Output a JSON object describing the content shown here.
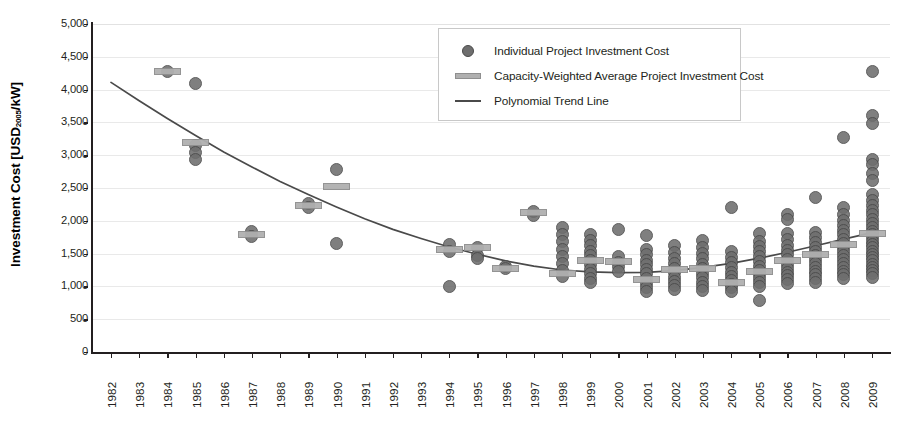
{
  "chart_data": {
    "type": "scatter",
    "title": "",
    "xlabel": "",
    "ylabel": "Investment Cost [USD2005/kW]",
    "ylabel_prefix": "Investment Cost [USD",
    "ylabel_sub": "2005",
    "ylabel_suffix": "/kW]",
    "xlim": [
      1982,
      2009
    ],
    "ylim": [
      0,
      5000
    ],
    "ytick_step": 500,
    "grid": true,
    "legend_position": "top-center",
    "colors": {
      "point_fill": "#6e6e6e",
      "point_stroke": "#4a4a4a",
      "avg_bar_fill": "#b0b0b0",
      "avg_bar_stroke": "#8f8f8f",
      "trend_line": "#4a4a4a",
      "axis": "#231f20",
      "gridline": "#e9e9e9",
      "background": "#ffffff"
    },
    "categories": [
      "1982",
      "1983",
      "1984",
      "1985",
      "1986",
      "1987",
      "1988",
      "1989",
      "1990",
      "1991",
      "1992",
      "1993",
      "1994",
      "1995",
      "1996",
      "1997",
      "1998",
      "1999",
      "2000",
      "2001",
      "2002",
      "2003",
      "2004",
      "2005",
      "2006",
      "2007",
      "2008",
      "2009"
    ],
    "yticks": [
      "0",
      "500",
      "1,000",
      "1,500",
      "2,000",
      "2,500",
      "3,000",
      "3,500",
      "4,000",
      "4,500",
      "5,000"
    ],
    "legend": [
      {
        "id": "individual",
        "marker": "circle",
        "label": "Individual Project Investment Cost"
      },
      {
        "id": "capacity-weighted-average",
        "marker": "bar",
        "label": "Capacity-Weighted Average Project Investment Cost"
      },
      {
        "id": "trend",
        "marker": "line",
        "label": "Polynomial Trend Line"
      }
    ],
    "series": [
      {
        "name": "Individual Project Investment Cost",
        "type": "scatter",
        "points": [
          {
            "x": 1984,
            "values": [
              4270
            ]
          },
          {
            "x": 1985,
            "values": [
              4100,
              3150,
              3040,
              2930
            ]
          },
          {
            "x": 1987,
            "values": [
              1840,
              1760
            ]
          },
          {
            "x": 1989,
            "values": [
              2260,
              2210
            ]
          },
          {
            "x": 1990,
            "values": [
              2780,
              1660
            ]
          },
          {
            "x": 1994,
            "values": [
              1640,
              1540,
              1000
            ]
          },
          {
            "x": 1995,
            "values": [
              1600,
              1470,
              1420
            ]
          },
          {
            "x": 1996,
            "values": [
              1310,
              1270
            ]
          },
          {
            "x": 1997,
            "values": [
              2140,
              2080
            ]
          },
          {
            "x": 1998,
            "values": [
              1900,
              1790,
              1680,
              1570,
              1460,
              1350,
              1240,
              1150
            ]
          },
          {
            "x": 1999,
            "values": [
              1790,
              1700,
              1620,
              1540,
              1470,
              1400,
              1330,
              1260,
              1190,
              1120,
              1060
            ]
          },
          {
            "x": 2000,
            "values": [
              1870,
              1450,
              1370,
              1300,
              1230
            ]
          },
          {
            "x": 2001,
            "values": [
              1780,
              1560,
              1480,
              1400,
              1330,
              1260,
              1190,
              1120,
              1050,
              990,
              930
            ]
          },
          {
            "x": 2002,
            "values": [
              1620,
              1520,
              1430,
              1350,
              1280,
              1210,
              1140,
              1070,
              1010,
              950
            ]
          },
          {
            "x": 2003,
            "values": [
              1700,
              1590,
              1500,
              1420,
              1340,
              1270,
              1200,
              1130,
              1060,
              1000,
              940
            ]
          },
          {
            "x": 2004,
            "values": [
              2210,
              1540,
              1440,
              1360,
              1290,
              1220,
              1150,
              1090,
              1030,
              980,
              930
            ]
          },
          {
            "x": 2005,
            "values": [
              1800,
              1690,
              1610,
              1530,
              1450,
              1380,
              1310,
              1240,
              1180,
              1120,
              1060,
              1000,
              790
            ]
          },
          {
            "x": 2006,
            "values": [
              2090,
              2020,
              1800,
              1710,
              1630,
              1550,
              1480,
              1410,
              1340,
              1280,
              1220,
              1160,
              1100,
              1040
            ]
          },
          {
            "x": 2007,
            "values": [
              2360,
              1830,
              1740,
              1670,
              1600,
              1530,
              1470,
              1410,
              1350,
              1290,
              1230,
              1180,
              1120,
              1060
            ]
          },
          {
            "x": 2008,
            "values": [
              3270,
              2200,
              2100,
              2010,
              1930,
              1860,
              1790,
              1720,
              1650,
              1590,
              1530,
              1470,
              1410,
              1350,
              1290,
              1230,
              1180,
              1120
            ]
          },
          {
            "x": 2009,
            "values": [
              4270,
              3600,
              3480,
              2940,
              2860,
              2720,
              2620,
              2400,
              2310,
              2230,
              2160,
              2090,
              2020,
              1960,
              1900,
              1840,
              1790,
              1740,
              1690,
              1640,
              1590,
              1540,
              1490,
              1440,
              1390,
              1340,
              1290,
              1240,
              1190,
              1140
            ]
          }
        ]
      },
      {
        "name": "Capacity-Weighted Average Project Investment Cost",
        "type": "bar-marker",
        "points": [
          {
            "x": 1984,
            "value": 4270
          },
          {
            "x": 1985,
            "value": 3200
          },
          {
            "x": 1987,
            "value": 1790
          },
          {
            "x": 1989,
            "value": 2230
          },
          {
            "x": 1990,
            "value": 2520
          },
          {
            "x": 1994,
            "value": 1560
          },
          {
            "x": 1995,
            "value": 1590
          },
          {
            "x": 1996,
            "value": 1280
          },
          {
            "x": 1997,
            "value": 2120
          },
          {
            "x": 1998,
            "value": 1190
          },
          {
            "x": 1999,
            "value": 1390
          },
          {
            "x": 2000,
            "value": 1380
          },
          {
            "x": 2001,
            "value": 1100
          },
          {
            "x": 2002,
            "value": 1260
          },
          {
            "x": 2003,
            "value": 1270
          },
          {
            "x": 2004,
            "value": 1060
          },
          {
            "x": 2005,
            "value": 1230
          },
          {
            "x": 2006,
            "value": 1400
          },
          {
            "x": 2007,
            "value": 1490
          },
          {
            "x": 2008,
            "value": 1640
          },
          {
            "x": 2009,
            "value": 1800
          }
        ]
      },
      {
        "name": "Polynomial Trend Line",
        "type": "line",
        "points": [
          {
            "x": 1982,
            "value": 4110
          },
          {
            "x": 1983,
            "value": 3830
          },
          {
            "x": 1984,
            "value": 3560
          },
          {
            "x": 1985,
            "value": 3300
          },
          {
            "x": 1986,
            "value": 3050
          },
          {
            "x": 1987,
            "value": 2820
          },
          {
            "x": 1988,
            "value": 2600
          },
          {
            "x": 1989,
            "value": 2400
          },
          {
            "x": 1990,
            "value": 2210
          },
          {
            "x": 1991,
            "value": 2030
          },
          {
            "x": 1992,
            "value": 1870
          },
          {
            "x": 1993,
            "value": 1730
          },
          {
            "x": 1994,
            "value": 1600
          },
          {
            "x": 1995,
            "value": 1490
          },
          {
            "x": 1996,
            "value": 1390
          },
          {
            "x": 1997,
            "value": 1310
          },
          {
            "x": 1998,
            "value": 1250
          },
          {
            "x": 1999,
            "value": 1220
          },
          {
            "x": 2000,
            "value": 1210
          },
          {
            "x": 2001,
            "value": 1215
          },
          {
            "x": 2002,
            "value": 1240
          },
          {
            "x": 2003,
            "value": 1290
          },
          {
            "x": 2004,
            "value": 1350
          },
          {
            "x": 2005,
            "value": 1430
          },
          {
            "x": 2006,
            "value": 1520
          },
          {
            "x": 2007,
            "value": 1620
          },
          {
            "x": 2008,
            "value": 1720
          },
          {
            "x": 2009,
            "value": 1820
          }
        ]
      }
    ]
  }
}
